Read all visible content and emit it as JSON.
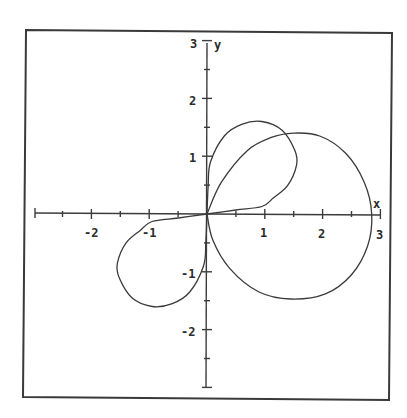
{
  "chart_data": {
    "type": "line",
    "title": "",
    "xlabel": "x",
    "ylabel": "y",
    "xlim": [
      -3,
      3
    ],
    "ylim": [
      -3,
      3
    ],
    "grid": false,
    "legend": null,
    "x_tick_labels": [
      "-2",
      "-1",
      "1",
      "2",
      "3"
    ],
    "y_tick_labels": [
      "3",
      "2",
      "1",
      "-1",
      "-2"
    ],
    "x_ticks": [
      -2.5,
      -2,
      -1.5,
      -1,
      -0.5,
      0.5,
      1,
      1.5,
      2,
      2.5,
      3
    ],
    "y_ticks": [
      -3,
      -2.5,
      -2,
      -1.5,
      -1,
      -0.5,
      0.5,
      1,
      1.5,
      2,
      2.5,
      3
    ],
    "series": [
      {
        "name": "upper small loop",
        "points": [
          [
            0,
            0
          ],
          [
            0.02,
            0.5
          ],
          [
            0.06,
            0.9
          ],
          [
            0.3,
            1.35
          ],
          [
            0.6,
            1.55
          ],
          [
            0.95,
            1.6
          ],
          [
            1.3,
            1.45
          ],
          [
            1.52,
            1.1
          ],
          [
            1.55,
            0.85
          ],
          [
            1.4,
            0.5
          ],
          [
            1.15,
            0.28
          ],
          [
            0.95,
            0.13
          ],
          [
            0.5,
            0.07
          ],
          [
            0,
            0
          ]
        ]
      },
      {
        "name": "large loop",
        "points": [
          [
            0,
            0
          ],
          [
            0.25,
            0.55
          ],
          [
            0.7,
            1.1
          ],
          [
            1.1,
            1.32
          ],
          [
            1.5,
            1.4
          ],
          [
            1.95,
            1.35
          ],
          [
            2.4,
            1.05
          ],
          [
            2.72,
            0.55
          ],
          [
            2.85,
            0
          ],
          [
            2.78,
            -0.55
          ],
          [
            2.5,
            -1.05
          ],
          [
            2.05,
            -1.38
          ],
          [
            1.45,
            -1.47
          ],
          [
            0.9,
            -1.35
          ],
          [
            0.4,
            -0.95
          ],
          [
            0.1,
            -0.45
          ],
          [
            0,
            0
          ]
        ]
      },
      {
        "name": "lower-left small loop",
        "points": [
          [
            0,
            0
          ],
          [
            -0.02,
            -0.5
          ],
          [
            -0.06,
            -0.9
          ],
          [
            -0.3,
            -1.35
          ],
          [
            -0.6,
            -1.55
          ],
          [
            -0.95,
            -1.6
          ],
          [
            -1.3,
            -1.45
          ],
          [
            -1.52,
            -1.1
          ],
          [
            -1.55,
            -0.85
          ],
          [
            -1.4,
            -0.5
          ],
          [
            -1.15,
            -0.28
          ],
          [
            -0.95,
            -0.13
          ],
          [
            -0.5,
            -0.07
          ],
          [
            0,
            0
          ]
        ]
      }
    ]
  },
  "labels": {
    "x_axis": "x",
    "y_axis": "y",
    "x_tick_neg2": "-2",
    "x_tick_neg1": "-1",
    "x_tick_1": "1",
    "x_tick_2": "2",
    "x_tick_3": "3",
    "y_tick_3": "3",
    "y_tick_2": "2",
    "y_tick_1": "1",
    "y_tick_neg1": "-1",
    "y_tick_neg2": "-2"
  },
  "colors": {
    "line": "#3a3a3a",
    "background": "#ffffff"
  }
}
